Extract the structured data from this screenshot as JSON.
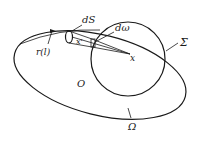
{
  "diagram": {
    "type": "geometry-illustration",
    "labels": {
      "dS": "dS",
      "d_omega": "dω",
      "x_prime": "x'",
      "x": "x",
      "sigma": "Σ",
      "omega": "Ω",
      "origin": "O",
      "curve": "r(l)"
    },
    "shapes": {
      "outer_region": "ellipse Ω",
      "sphere": "circle Σ",
      "surface_element": "small cylinder dS at x'",
      "solid_angle_cone": "cone from x' to x"
    },
    "colors": {
      "ink": "#1a1a1a",
      "background": "#ffffff"
    }
  }
}
